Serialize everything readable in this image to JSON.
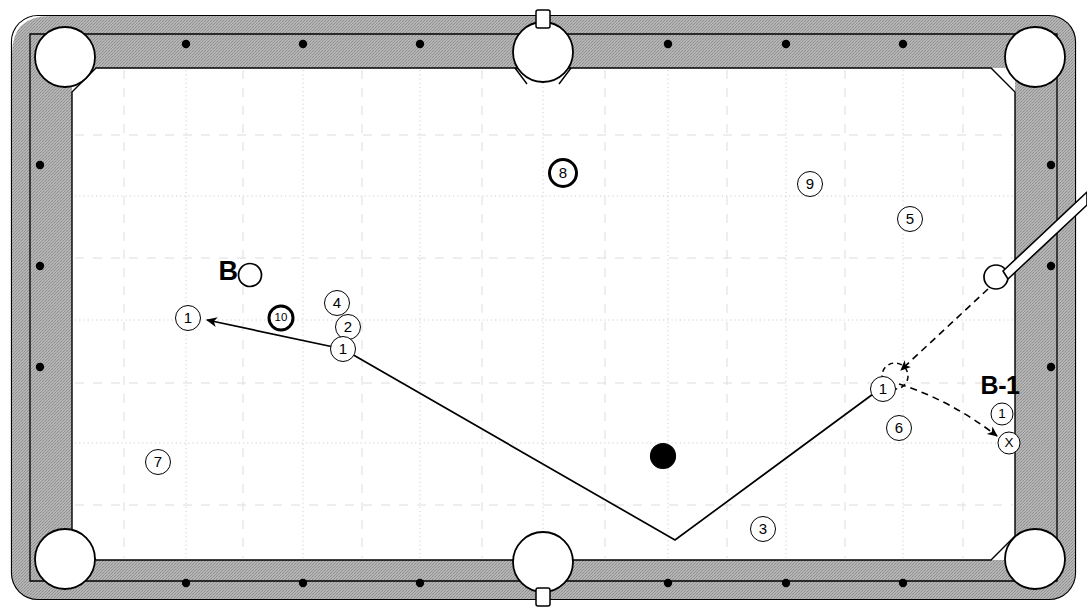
{
  "diagram": {
    "type": "billiards-shot-diagram",
    "surface_color": "#ffffff",
    "rail_color": "#a8a8a8",
    "line_color": "#000000",
    "grid_color": "#c9c9c9"
  },
  "labels": {
    "cue_label": "B",
    "target_label": "B-1"
  },
  "balls": [
    {
      "id": "ball-8",
      "label": "8",
      "x": 563,
      "y": 173,
      "style": "heavy"
    },
    {
      "id": "ball-9",
      "label": "9",
      "x": 810,
      "y": 184,
      "style": "light"
    },
    {
      "id": "ball-5",
      "label": "5",
      "x": 910,
      "y": 219,
      "style": "light"
    },
    {
      "id": "ball-10",
      "label": "10",
      "x": 281,
      "y": 318,
      "style": "heavy"
    },
    {
      "id": "ball-4",
      "label": "4",
      "x": 337,
      "y": 303,
      "style": "light"
    },
    {
      "id": "ball-2",
      "label": "2",
      "x": 348,
      "y": 327,
      "style": "light"
    },
    {
      "id": "ball-1-contact",
      "label": "1",
      "x": 343,
      "y": 349,
      "style": "light"
    },
    {
      "id": "ball-1-pocket",
      "label": "1",
      "x": 188,
      "y": 318,
      "style": "light"
    },
    {
      "id": "ball-7",
      "label": "7",
      "x": 158,
      "y": 462,
      "style": "light"
    },
    {
      "id": "ball-3",
      "label": "3",
      "x": 763,
      "y": 529,
      "style": "light"
    },
    {
      "id": "ball-1-ghost",
      "label": "1",
      "x": 883,
      "y": 389,
      "style": "light"
    },
    {
      "id": "ball-6",
      "label": "6",
      "x": 899,
      "y": 428,
      "style": "light"
    },
    {
      "id": "ball-1-target",
      "label": "1",
      "x": 1002,
      "y": 414,
      "style": "light"
    },
    {
      "id": "ball-x",
      "label": "X",
      "x": 1009,
      "y": 443,
      "style": "light"
    }
  ],
  "object_balls": [
    {
      "id": "cue-ball",
      "x": 250,
      "y": 275,
      "r": 11,
      "fill": "#ffffff",
      "desc": "cue-ball-B"
    },
    {
      "id": "shooter-ball",
      "x": 996,
      "y": 277,
      "r": 12,
      "fill": "#ffffff",
      "desc": "cue-ball-shooting"
    },
    {
      "id": "black-ball",
      "x": 663,
      "y": 456,
      "r": 12,
      "fill": "#000000",
      "desc": "eight-ball-solid"
    }
  ],
  "paths": {
    "solid_path": {
      "style": "solid",
      "points": [
        [
          343,
          349
        ],
        [
          675,
          540
        ],
        [
          888,
          383
        ]
      ],
      "arrow_at": [
        207,
        320
      ],
      "arrow_from": [
        343,
        349
      ],
      "desc": "object ball bank path to pocket"
    },
    "dashed_path_cue": {
      "style": "dashed",
      "points": [
        [
          990,
          287
        ],
        [
          900,
          371
        ]
      ],
      "arrow_at": [
        900,
        371
      ],
      "desc": "cue ball travel to contact point"
    },
    "dashed_path_target": {
      "style": "dashed",
      "points": [
        [
          898,
          382
        ],
        [
          940,
          410
        ],
        [
          1000,
          437
        ]
      ],
      "arrow_at": [
        1000,
        437
      ],
      "desc": "cue ball deflection to target X"
    },
    "ghost_ball": {
      "x": 895,
      "y": 376,
      "r": 13,
      "style": "dashed"
    }
  },
  "cue_stick": {
    "tip": [
      1003,
      272
    ],
    "butt": [
      1087,
      196
    ],
    "color_fill": "#ffffff",
    "color_outline": "#000000"
  },
  "table": {
    "outer": {
      "x": 12,
      "y": 16,
      "w": 1063,
      "h": 583
    },
    "playfield": {
      "x": 72,
      "y": 68,
      "w": 943,
      "h": 492
    },
    "pockets": [
      {
        "id": "pocket-top-left",
        "x": 65,
        "y": 57,
        "r": 30
      },
      {
        "id": "pocket-top-center",
        "x": 543,
        "y": 52,
        "r": 30
      },
      {
        "id": "pocket-top-right",
        "x": 1035,
        "y": 57,
        "r": 30
      },
      {
        "id": "pocket-bottom-left",
        "x": 65,
        "y": 559,
        "r": 30
      },
      {
        "id": "pocket-bottom-center",
        "x": 543,
        "y": 562,
        "r": 30
      },
      {
        "id": "pocket-bottom-right",
        "x": 1035,
        "y": 559,
        "r": 30
      }
    ],
    "rail_dots_top": [
      186,
      303,
      420,
      668,
      786,
      903
    ],
    "rail_dots_bottom": [
      186,
      303,
      420,
      668,
      786,
      903
    ],
    "rail_dots_left": [
      165,
      266,
      367
    ],
    "rail_dots_right": [
      165,
      266,
      367
    ],
    "rail_dot_y_top": 44,
    "rail_dot_y_bottom": 583,
    "rail_dot_x_left": 40,
    "rail_dot_x_right": 1051
  },
  "grid": {
    "v_major": [
      186,
      303,
      420,
      543,
      668,
      786,
      903
    ],
    "v_minor": [
      124,
      243,
      362,
      482,
      605,
      727,
      845,
      963
    ],
    "h_major": [
      196,
      320,
      443
    ],
    "h_minor": [
      135,
      258,
      383,
      505
    ],
    "style_major": "dotted",
    "style_minor": "dashed"
  }
}
